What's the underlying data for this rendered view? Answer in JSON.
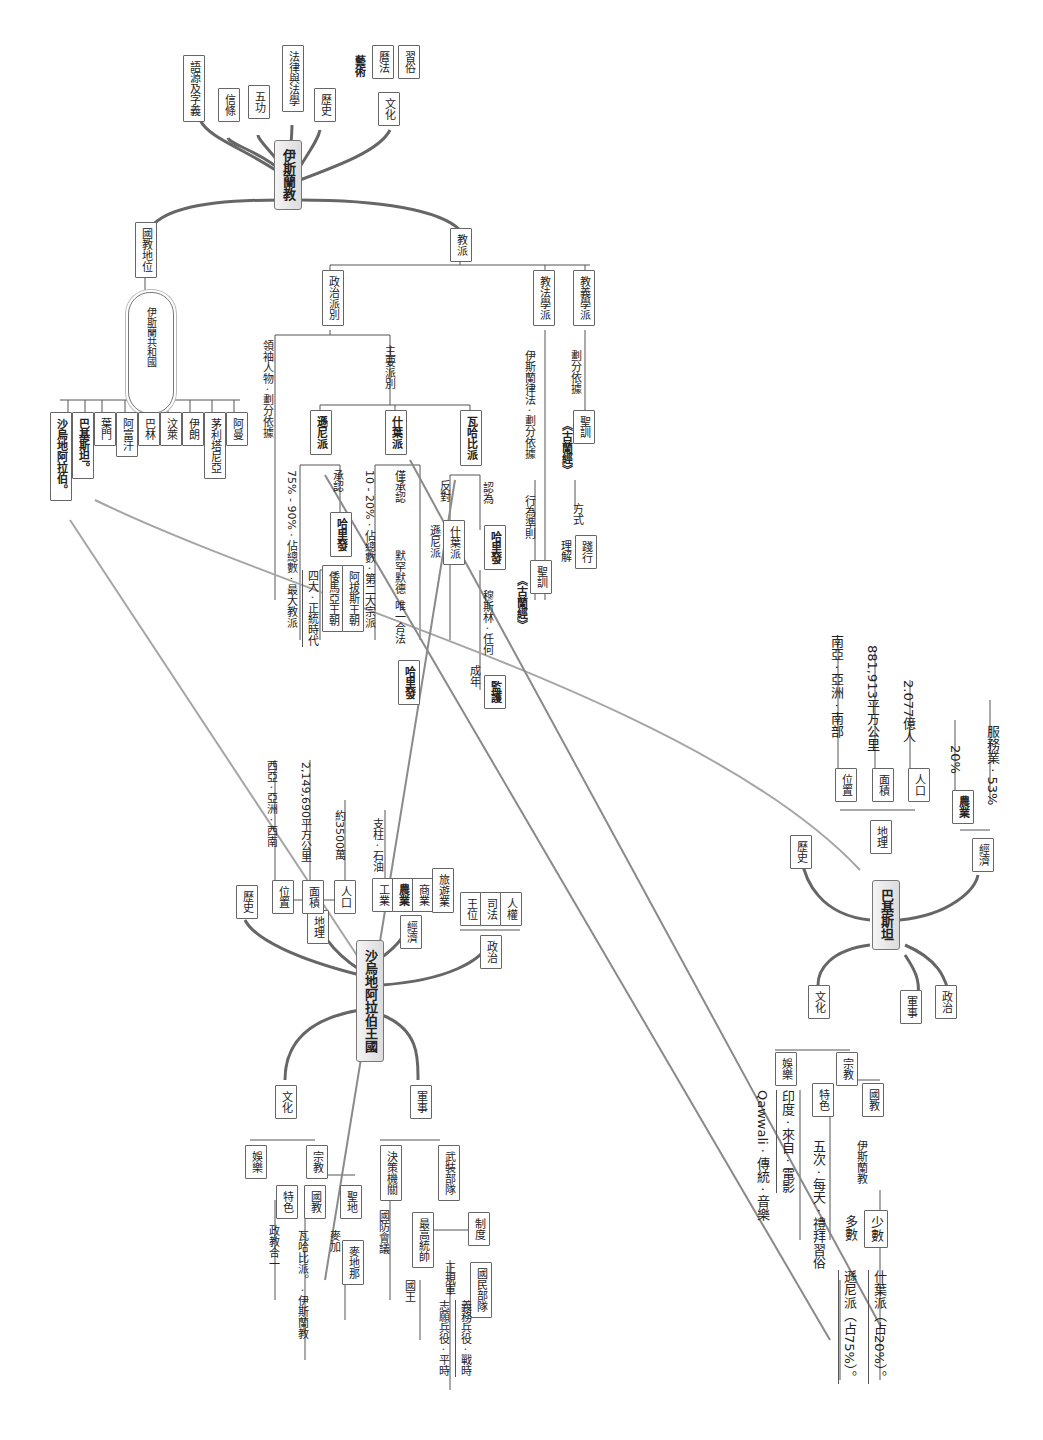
{
  "islam_map": {
    "hub": "伊斯蘭教",
    "branches": [
      "語源及字義",
      "信條",
      "五功",
      "法律與法學",
      "歷史",
      "文化",
      "國教地位",
      "教派"
    ],
    "culture_children": [
      "藝術",
      "曆法",
      "習俗"
    ],
    "state_religion": {
      "cloud": "伊斯蘭共和國",
      "countries": [
        "沙烏地阿拉伯。",
        "巴基斯坦。",
        "葉門",
        "阿富汗",
        "巴林",
        "汶萊",
        "伊朗",
        "茅利塔尼亞",
        "阿曼"
      ]
    },
    "sects": {
      "label": "教派",
      "political": {
        "label": "政治派別",
        "criterion": "領袖人物 · 劃分依據",
        "main_label": "主要派別",
        "sunni": {
          "label": "遜尼派",
          "share": "75% - 90% · 佔總數 · 最大教派",
          "acknowledge": "承認",
          "hariph": "哈里發",
          "era": "四大 · 正統時代",
          "dynasties": [
            "倭馬亞王朝",
            "阿拔斯王朝"
          ]
        },
        "shia": {
          "label": "什葉派",
          "share": "10 - 20% · 佔總數 · 第二大宗派",
          "acknowledge": "僅承認",
          "only_legit": "唯一合法",
          "ali": "默罕默德",
          "hariph": "哈里發",
          "adult": "成年",
          "guardian": "監護"
        },
        "wahhabi": {
          "label": "瓦哈比派",
          "oppose": "反對",
          "regard": "認為",
          "sub": [
            "遜尼派",
            "什葉派"
          ],
          "hariph": "哈里發",
          "muslim": "穆斯林 · 任何"
        }
      },
      "jurisprudence": {
        "label": "教法學派",
        "criterion": "伊斯蘭律法 · 劃分依據",
        "rule": "行為準則",
        "sunnah": "聖訓",
        "quran": "《古蘭經》"
      },
      "theology": {
        "label": "教義學派",
        "criterion": "劃分依據",
        "sunnah": "聖訓",
        "quran": "《古蘭經》",
        "understand": "理解",
        "method": "方式",
        "practice": "踐行"
      }
    }
  },
  "saudi_map": {
    "hub": "沙烏地阿拉伯王國",
    "history": "歷史",
    "geography": {
      "label": "地理",
      "location": {
        "label": "位置",
        "value": "西亞 · 亞洲 · 西南"
      },
      "area": {
        "label": "面積",
        "value": "2,149,690平方公里"
      },
      "population": {
        "label": "人口",
        "value": "約3500萬"
      }
    },
    "economy": {
      "label": "經濟",
      "items": [
        "工業",
        "農業",
        "商業",
        "旅遊業"
      ],
      "pillar": "支柱 · 石油"
    },
    "politics": {
      "label": "政治",
      "items": [
        "王位",
        "司法",
        "人權"
      ]
    },
    "culture": {
      "label": "文化",
      "entertainment": "娛樂",
      "religion": "宗教",
      "features": "特色",
      "state_religion": "國教",
      "holy": "聖地",
      "theocracy": "政教合一",
      "wahhabi": "瓦哈比派。 · 伊斯蘭教",
      "mecca": "麥加",
      "medina": "麥地那"
    },
    "military": {
      "label": "軍事",
      "decision": "決策機關",
      "defense_council": "國防會議",
      "forces": "武裝部隊",
      "commander": "最高統帥",
      "king": "國王",
      "system": "制度",
      "regular": "正規軍",
      "national_guard": "國民部隊",
      "volunteer": "志願兵役 · 平時",
      "conscription": "義務兵役 · 戰時"
    }
  },
  "pakistan_map": {
    "hub": "巴基斯坦",
    "history": "歷史",
    "geography": {
      "label": "地理",
      "location": {
        "label": "位置",
        "value": "南亞 · 亞洲 · 南部"
      },
      "area": {
        "label": "面積",
        "value": "881,913平方公里"
      },
      "population": {
        "label": "人口",
        "value": "2.077億人"
      }
    },
    "economy": {
      "label": "經濟",
      "agriculture": {
        "label": "農業",
        "value": "20%"
      },
      "services": "服務業 · 53%"
    },
    "culture": {
      "label": "文化",
      "entertainment": "娛樂",
      "music": "Qawwali · 傳統 · 音樂",
      "film": "印度 · 來自 · 電影",
      "religion": "宗教",
      "features": "特色",
      "prayer": "五次 · 每天 · 禮拜習俗",
      "state_religion": "國教",
      "islam": "伊斯蘭教",
      "majority": "多數",
      "minority": "少數",
      "sunni": "遜尼派（占75%）。",
      "shia": "什葉派（占20%）。"
    },
    "military": "軍事",
    "politics": "政治"
  },
  "colors": {
    "line": "#6f6f6f",
    "link": "#9a9a9a",
    "hub_bg": "#e4e4e4",
    "box_border": "#666666"
  }
}
